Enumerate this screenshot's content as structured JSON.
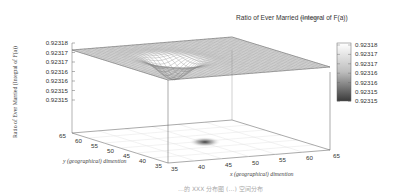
{
  "chart_data": {
    "type": "surface3d",
    "title": "Ratio of Ever Married (Integral of F(a))",
    "legend": {
      "label": "Ratio of Ever Married (Integral of F(a))",
      "position": "top-right"
    },
    "xlabel": "x (geographical) dimention",
    "ylabel": "y (geographical) dimention",
    "zlabel": "Ratio of Ever Married (Integral of F(a))",
    "x_ticks": [
      "35",
      "40",
      "45",
      "50",
      "55",
      "60",
      "65"
    ],
    "y_ticks": [
      "35",
      "40",
      "45",
      "50",
      "55",
      "60",
      "65"
    ],
    "z_ticks": [
      "0.92318",
      "0.92317",
      "0.92317",
      "0.92316",
      "0.92316",
      "0.92315",
      "0.92315"
    ],
    "xlim": [
      35,
      65
    ],
    "ylim": [
      35,
      65
    ],
    "zlim": [
      0.92315,
      0.92318
    ],
    "surface": {
      "baseline": 0.923175,
      "dip_center": {
        "x": 45,
        "y": 50
      },
      "dip_min": 0.92315,
      "description": "Flat surface at ~0.923175 with a single localized downward dip near x=45, y=50"
    },
    "colorbox": {
      "labels": [
        "0.92318",
        "0.92317",
        "0.92317",
        "0.92316",
        "0.92316",
        "0.92315",
        "0.92315"
      ],
      "colormap": "grayscale (white high, dark low)"
    },
    "projection": "heatmap on floor plane showing dark spot at dip",
    "grid": true
  },
  "caption": "…的 XXX 分布图 (…) 空间分布"
}
